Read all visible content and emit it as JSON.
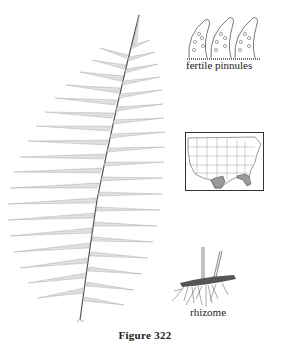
{
  "figure": {
    "caption": "Figure 322",
    "signature": "B.M.",
    "labels": {
      "fertile_pinnules": "fertile pinnules",
      "rhizome": "rhizome"
    },
    "panels": [
      {
        "name": "frond",
        "description": "pinnate fern frond illustration"
      },
      {
        "name": "fertile-pinnules",
        "description": "three fertile pinnules with sori"
      },
      {
        "name": "range-map",
        "description": "map of contiguous United States with shaded range in southeast (Texas/Louisiana coast and Georgia/Florida/Carolinas)"
      },
      {
        "name": "rhizome",
        "description": "creeping rhizome with roots and two stipe bases"
      }
    ]
  }
}
